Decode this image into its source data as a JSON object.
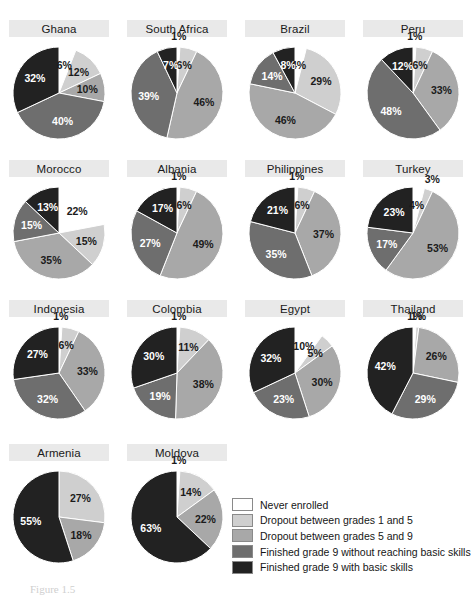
{
  "chart_data": {
    "type": "pie",
    "title": "",
    "legend_position": "bottom-right",
    "legend": [
      {
        "label": "Never enrolled",
        "color": "#ffffff"
      },
      {
        "label": "Dropout between grades 1 and 5",
        "color": "#cfcfcf"
      },
      {
        "label": "Dropout between grades 5 and 9",
        "color": "#a8a8a8"
      },
      {
        "label": "Finished grade 9 without reaching basic skills",
        "color": "#6e6e6e"
      },
      {
        "label": "Finished grade 9 with basic skills",
        "color": "#222222"
      }
    ],
    "categories": [
      "Never enrolled",
      "Dropout between grades 1 and 5",
      "Dropout between grades 5 and 9",
      "Finished grade 9 without reaching basic skills",
      "Finished grade 9 with basic skills"
    ],
    "unit": "%",
    "panels": [
      {
        "name": "Ghana",
        "values": [
          6,
          12,
          10,
          40,
          32
        ],
        "labels": [
          "6%",
          "12%",
          "10%",
          "40%",
          "32%"
        ]
      },
      {
        "name": "South Africa",
        "values": [
          1,
          6,
          46,
          39,
          7
        ],
        "labels": [
          "1%",
          "6%",
          "46%",
          "39%",
          "7%"
        ]
      },
      {
        "name": "Brazil",
        "values": [
          4,
          29,
          46,
          14,
          8
        ],
        "labels": [
          "4%",
          "29%",
          "46%",
          "14%",
          "8%"
        ]
      },
      {
        "name": "Peru",
        "values": [
          1,
          6,
          33,
          48,
          12
        ],
        "labels": [
          "1%",
          "6%",
          "33%",
          "48%",
          "12%"
        ]
      },
      {
        "name": "Morocco",
        "values": [
          22,
          15,
          35,
          15,
          13
        ],
        "labels": [
          "22%",
          "15%",
          "35%",
          "15%",
          "13%"
        ]
      },
      {
        "name": "Albania",
        "values": [
          1,
          6,
          49,
          27,
          17
        ],
        "labels": [
          "1%",
          "6%",
          "49%",
          "27%",
          "17%"
        ]
      },
      {
        "name": "Philippines",
        "values": [
          1,
          6,
          37,
          35,
          21
        ],
        "labels": [
          "1%",
          "6%",
          "37%",
          "35%",
          "21%"
        ]
      },
      {
        "name": "Turkey",
        "values": [
          4,
          3,
          53,
          17,
          23
        ],
        "labels": [
          "4%",
          "3%",
          "53%",
          "17%",
          "23%"
        ]
      },
      {
        "name": "Indonesia",
        "values": [
          1,
          6,
          33,
          32,
          27
        ],
        "labels": [
          "1%",
          "6%",
          "33%",
          "32%",
          "27%"
        ]
      },
      {
        "name": "Colombia",
        "values": [
          1,
          11,
          38,
          19,
          30
        ],
        "labels": [
          "1%",
          "11%",
          "38%",
          "19%",
          "30%"
        ]
      },
      {
        "name": "Egypt",
        "values": [
          10,
          5,
          30,
          23,
          32
        ],
        "labels": [
          "10%",
          "5%",
          "30%",
          "23%",
          "32%"
        ]
      },
      {
        "name": "Thailand",
        "values": [
          1,
          1,
          26,
          29,
          42
        ],
        "labels": [
          "1%",
          "1%",
          "26%",
          "29%",
          "42%"
        ]
      },
      {
        "name": "Armenia",
        "values": [
          0,
          27,
          18,
          0,
          55
        ],
        "labels": [
          "",
          "27%",
          "18%",
          "",
          "55%"
        ]
      },
      {
        "name": "Moldova",
        "values": [
          1,
          14,
          22,
          0,
          63
        ],
        "labels": [
          "1%",
          "14%",
          "22%",
          "",
          "63%"
        ]
      }
    ]
  },
  "caption": {
    "text": "Figure 1.5"
  }
}
